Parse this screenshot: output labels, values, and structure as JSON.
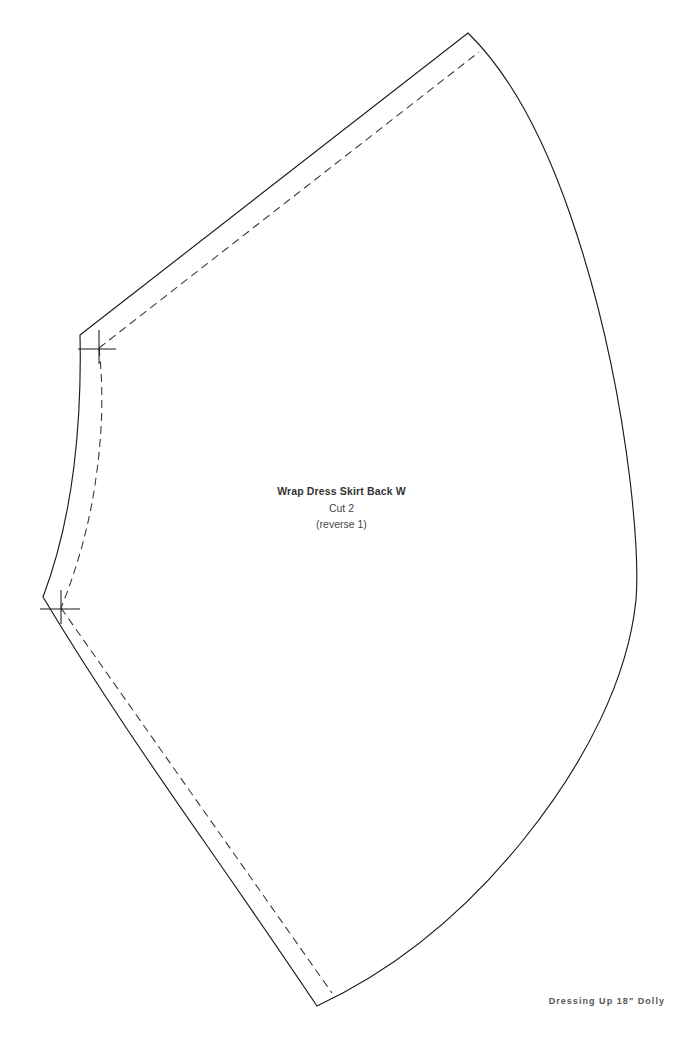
{
  "document": {
    "kind": "sewing-pattern-piece",
    "page_background": "#ffffff",
    "width_px": 683,
    "height_px": 1039
  },
  "piece": {
    "name": "Wrap Dress Skirt Back W",
    "cut_instruction": "Cut 2",
    "reverse_instruction": "(reverse 1)",
    "cut_line_color": "#1b1b1b",
    "seam_line_color": "#333333"
  },
  "footer": {
    "brand": "Dressing Up 18\" Dolly",
    "color": "#565656"
  },
  "geometry": {
    "cut_outline": "M 80 335 L 468 33 C 545 110 602 300 636 560 C 620 700 490 890 317 1006 C 243 876 160 727 43 597 C 63 520 80 430 80 335 Z",
    "seam_allowance": "M 98 347 L 463 63 M 108 357 C 128 430 118 520 100 590 M 62 610 L 331 992",
    "waist_curve": "M 80 335 C 82 430 72 520 43 597",
    "seam_waist_curve": "M 97 349 C 101 438 92 530 60 608",
    "notch_top": "M 80 335 L 98 347 M 98 332 L 98 360 M 80 349 L 112 349",
    "notch_bottom": "M 43 597 L 62 610 M 62 594 L 62 622 M 43 611 L 75 611"
  }
}
